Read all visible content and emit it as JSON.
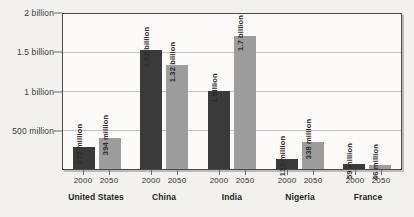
{
  "chart_data": {
    "type": "bar",
    "title": "",
    "xlabel": "",
    "ylabel": "",
    "ylim": [
      0,
      2000000000
    ],
    "grid": true,
    "legend": "none",
    "categories": [
      "United States",
      "China",
      "India",
      "Nigeria",
      "France"
    ],
    "series": [
      {
        "name": "2000",
        "color": "#3a3a3a",
        "values": [
          275000000,
          1520000000,
          1000000000,
          132000000,
          59000000
        ],
        "labels": [
          "275 million",
          "1.52 billion",
          "1 billion",
          "132 million",
          "59 million"
        ]
      },
      {
        "name": "2050",
        "color": "#9d9d9d",
        "values": [
          394000000,
          1320000000,
          1700000000,
          338000000,
          46000000
        ],
        "labels": [
          "394 million",
          "1.32 billion",
          "1.7 billion",
          "338 million",
          "46 million"
        ]
      }
    ],
    "yticks": [
      {
        "value": 2000000000,
        "label": "2 billion"
      },
      {
        "value": 1500000000,
        "label": "1.5 billion"
      },
      {
        "value": 1000000000,
        "label": "1 billion"
      },
      {
        "value": 500000000,
        "label": "500 million"
      }
    ]
  },
  "colors": {
    "bar_2000": "#3a3a3a",
    "bar_2050": "#9d9d9d",
    "background": "#f2f1ee",
    "plot_background": "#fbfaf8",
    "frame": "#4a4a4a",
    "gridline": "#c8c6c2"
  }
}
